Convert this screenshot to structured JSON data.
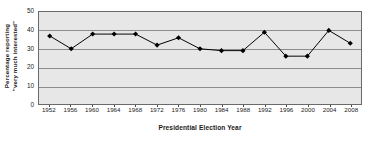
{
  "chart_data": {
    "type": "line",
    "title": "",
    "xlabel": "Presidential Election Year",
    "ylabel_lines": [
      "Percentage reporting",
      "\"very much interested\""
    ],
    "ylabel": "Percentage reporting \"very much interested\"",
    "categories": [
      1952,
      1956,
      1960,
      1964,
      1968,
      1972,
      1976,
      1980,
      1984,
      1988,
      1992,
      1996,
      2000,
      2004,
      2008
    ],
    "x_tick_labels": [
      "1952",
      "1956",
      "1960",
      "1964",
      "1968",
      "1972",
      "1976",
      "1980",
      "1984",
      "1988",
      "1992",
      "1996",
      "2000",
      "2004",
      "2008"
    ],
    "values": [
      37,
      30,
      38,
      38,
      38,
      32,
      36,
      30,
      29,
      29,
      39,
      26,
      26,
      40,
      33
    ],
    "ylim": [
      0,
      50
    ],
    "y_tick_labels": [
      "0",
      "10",
      "20",
      "30",
      "40",
      "50"
    ],
    "y_ticks": [
      0,
      10,
      20,
      30,
      40,
      50
    ],
    "grid": true,
    "legend": "none",
    "marker": "diamond",
    "colors": {
      "line": "#000000",
      "marker": "#000000",
      "plot_background": "#e7e7e7",
      "gridline": "#8c8c8c",
      "axis_border": "#6a6a6a",
      "text": "#1a1a1a",
      "figure_background": "#ffffff"
    }
  }
}
